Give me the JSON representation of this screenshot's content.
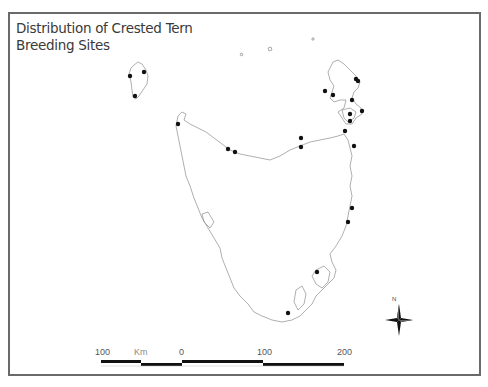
{
  "title": {
    "line1": "Distribution of Crested Tern",
    "line2": "Breeding Sites"
  },
  "scale_bar": {
    "unit": "Km",
    "labels": [
      "100",
      "0",
      "100",
      "200"
    ]
  },
  "north_arrow": {
    "label": "N",
    "icon": "compass-star-icon"
  },
  "colors": {
    "frame": "#6a6a6a",
    "coastline": "#8c8c8c",
    "site_marker": "#111111",
    "title_text": "#3a3a3a"
  },
  "breeding_sites": [
    {
      "x": 130,
      "y": 76
    },
    {
      "x": 144,
      "y": 72
    },
    {
      "x": 135,
      "y": 96
    },
    {
      "x": 178,
      "y": 124
    },
    {
      "x": 228,
      "y": 149
    },
    {
      "x": 235,
      "y": 152
    },
    {
      "x": 301,
      "y": 138
    },
    {
      "x": 301,
      "y": 147
    },
    {
      "x": 356,
      "y": 79
    },
    {
      "x": 358,
      "y": 81
    },
    {
      "x": 325,
      "y": 91
    },
    {
      "x": 333,
      "y": 95
    },
    {
      "x": 352,
      "y": 100
    },
    {
      "x": 362,
      "y": 111
    },
    {
      "x": 350,
      "y": 114
    },
    {
      "x": 350,
      "y": 121
    },
    {
      "x": 345,
      "y": 131
    },
    {
      "x": 354,
      "y": 146
    },
    {
      "x": 352,
      "y": 208
    },
    {
      "x": 348,
      "y": 222
    },
    {
      "x": 317,
      "y": 272
    },
    {
      "x": 288,
      "y": 313
    }
  ]
}
